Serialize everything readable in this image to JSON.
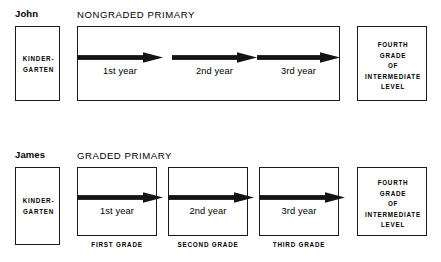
{
  "diagram": {
    "title_text": "Nongraded vs Graded Primary Progression",
    "ink_color": "#1a1a1a",
    "background_color": "#ffffff"
  },
  "rows": [
    {
      "student_name": "John",
      "program_header": "NONGRADED PRIMARY",
      "kindergarten": {
        "line1": "KINDER-",
        "line2": "GARTEN"
      },
      "segments": [
        {
          "year_label": "1st year",
          "grade_caption": ""
        },
        {
          "year_label": "2nd year",
          "grade_caption": ""
        },
        {
          "year_label": "3rd year",
          "grade_caption": ""
        }
      ],
      "destination": {
        "line1": "FOURTH",
        "line2": "GRADE",
        "line3": "OF",
        "line4": "INTERMEDIATE",
        "line5": "LEVEL"
      }
    },
    {
      "student_name": "James",
      "program_header": "GRADED PRIMARY",
      "kindergarten": {
        "line1": "KINDER-",
        "line2": "GARTEN"
      },
      "segments": [
        {
          "year_label": "1st year",
          "grade_caption": "FIRST GRADE"
        },
        {
          "year_label": "2nd year",
          "grade_caption": "SECOND GRADE"
        },
        {
          "year_label": "3rd year",
          "grade_caption": "THIRD GRADE"
        }
      ],
      "destination": {
        "line1": "FOURTH",
        "line2": "GRADE",
        "line3": "OF",
        "line4": "INTERMEDIATE",
        "line5": "LEVEL"
      }
    }
  ]
}
